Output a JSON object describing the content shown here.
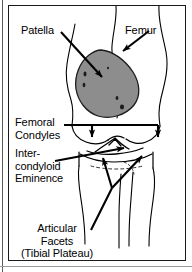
{
  "figure": {
    "view": "anterior",
    "style": "line-drawing",
    "colors": {
      "ink": "#000000",
      "patella_fill": "#8d8d8d",
      "frame": "#1a1a1a",
      "background": "#ffffff",
      "rule": "#5a5a5a"
    }
  },
  "labels": {
    "patella": "Patella",
    "femur": "Femur",
    "femoral_condyles_line1": "Femoral",
    "femoral_condyles_line2": "Condyles",
    "intercondyloid_line1": "Inter-",
    "intercondyloid_line2": "condyloid",
    "intercondyloid_line3": "Eminence",
    "articular_facets_line1": "Articular",
    "articular_facets_line2": "Facets",
    "articular_facets_line3": "(Tibial Plateau)"
  },
  "annotations": [
    {
      "name": "patella-leader",
      "label": "Patella",
      "type": "arrow",
      "from": [
        52,
        26
      ],
      "to": [
        94,
        72
      ],
      "points_at": "patella-shape"
    },
    {
      "name": "femur-leader",
      "label": "Femur",
      "type": "arrow",
      "from": [
        139,
        25
      ],
      "to": [
        113,
        45
      ],
      "points_at": "femur-shaft"
    },
    {
      "name": "femoral-condyles-leader",
      "label": "Femoral Condyles",
      "type": "bracket-two-arrows",
      "from": [
        62,
        119
      ],
      "to": [
        [
          83,
          136
        ],
        [
          149,
          136
        ]
      ],
      "points_at": "femoral-condyles"
    },
    {
      "name": "intercondyloid-eminence-leader",
      "label": "Intercondyloid Eminence",
      "type": "arrow",
      "from": [
        50,
        154
      ],
      "to": [
        117,
        143
      ],
      "points_at": "intercondyloid-eminence"
    },
    {
      "name": "articular-facets-leader",
      "label": "Articular Facets (Tibial Plateau)",
      "type": "branching-arrows",
      "from": [
        82,
        224
      ],
      "to": [
        [
          95,
          152
        ],
        [
          134,
          150
        ]
      ],
      "points_at": "tibial-plateau"
    }
  ],
  "structures": [
    {
      "name": "patella",
      "label": "Patella",
      "shaded": true
    },
    {
      "name": "femur",
      "label": "Femur",
      "shaded": false
    },
    {
      "name": "femoral-condyles",
      "label": "Femoral Condyles",
      "shaded": false
    },
    {
      "name": "intercondyloid-eminence",
      "label": "Intercondyloid Eminence",
      "shaded": false
    },
    {
      "name": "tibial-plateau",
      "label": "Articular Facets (Tibial Plateau)",
      "shaded": false
    },
    {
      "name": "tibia",
      "label": "Tibia",
      "shaded": false
    },
    {
      "name": "fibula",
      "label": "Fibula",
      "shaded": false
    }
  ]
}
